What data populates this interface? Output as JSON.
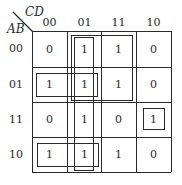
{
  "kmap": {
    "row_var": "AB",
    "col_var": "CD",
    "col_labels": [
      "00",
      "01",
      "11",
      "10"
    ],
    "row_labels": [
      "00",
      "01",
      "11",
      "10"
    ],
    "cells": [
      [
        "0",
        "1",
        "1",
        "0"
      ],
      [
        "1",
        "1",
        "1",
        "0"
      ],
      [
        "0",
        "1",
        "0",
        "1"
      ],
      [
        "1",
        "1",
        "1",
        "0"
      ]
    ],
    "groups": [
      {
        "name": "group-rows00-01-cols01-11",
        "rows": [
          "00",
          "01"
        ],
        "cols": [
          "01",
          "11"
        ]
      },
      {
        "name": "group-col01-all-rows",
        "rows": [
          "00",
          "01",
          "11",
          "10"
        ],
        "cols": [
          "01"
        ]
      },
      {
        "name": "group-row01-cols00-01",
        "rows": [
          "01"
        ],
        "cols": [
          "00",
          "01"
        ]
      },
      {
        "name": "group-row10-cols00-01",
        "rows": [
          "10"
        ],
        "cols": [
          "00",
          "01"
        ]
      },
      {
        "name": "group-row11-col10",
        "rows": [
          "11"
        ],
        "cols": [
          "10"
        ]
      }
    ],
    "line_color": "#2a2a2a"
  }
}
